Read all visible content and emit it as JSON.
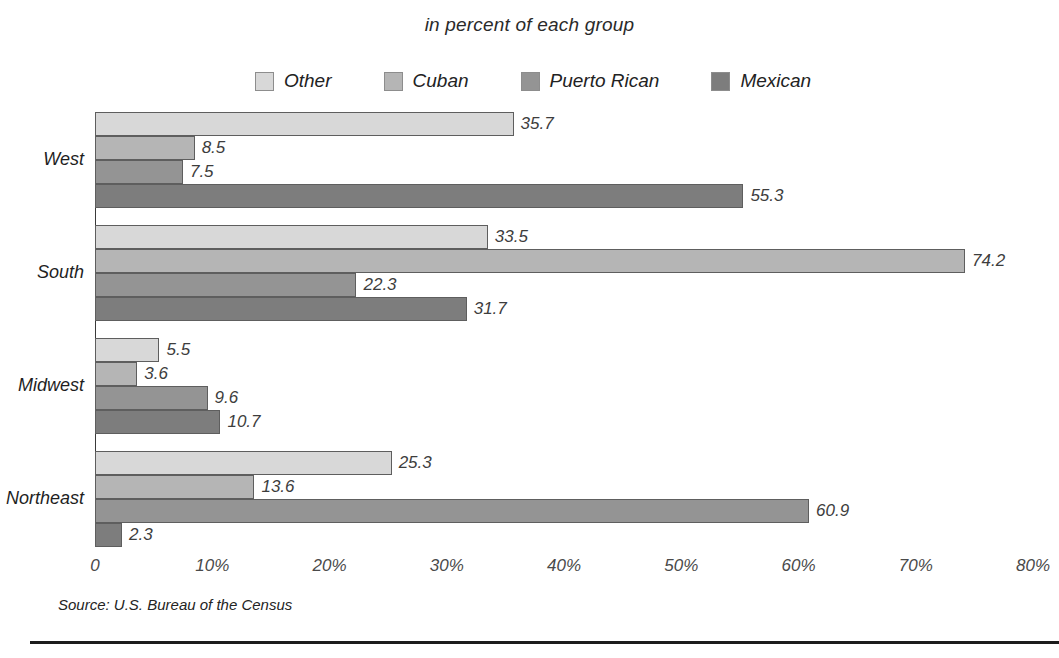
{
  "chart_data": {
    "type": "bar",
    "orientation": "horizontal",
    "grouped": true,
    "title": "in percent of each group",
    "xlabel": "",
    "ylabel": "",
    "xlim": [
      0,
      80
    ],
    "grid": false,
    "legend_position": "top",
    "categories": [
      "West",
      "South",
      "Midwest",
      "Northeast"
    ],
    "series": [
      {
        "name": "Other",
        "color": "#d8d8d8",
        "values": [
          35.7,
          33.5,
          5.5,
          25.3
        ]
      },
      {
        "name": "Cuban",
        "color": "#b5b5b5",
        "values": [
          8.5,
          74.2,
          3.6,
          13.6
        ]
      },
      {
        "name": "Puerto Rican",
        "color": "#949494",
        "values": [
          7.5,
          22.3,
          9.6,
          60.9
        ]
      },
      {
        "name": "Mexican",
        "color": "#7d7d7d",
        "values": [
          55.3,
          31.7,
          10.7,
          2.3
        ]
      }
    ],
    "xticks": [
      0,
      10,
      20,
      30,
      40,
      50,
      60,
      70,
      80
    ],
    "xtick_labels": [
      "0",
      "10%",
      "20%",
      "30%",
      "40%",
      "50%",
      "60%",
      "70%",
      "80%"
    ],
    "value_labels": {
      "West": [
        "35.7",
        "8.5",
        "7.5",
        "55.3"
      ],
      "South": [
        "33.5",
        "74.2",
        "22.3",
        "31.7"
      ],
      "Midwest": [
        "5.5",
        "3.6",
        "9.6",
        "10.7"
      ],
      "Northeast": [
        "25.3",
        "13.6",
        "60.9",
        "2.3"
      ]
    },
    "source": "Source: U.S. Bureau of the Census"
  }
}
